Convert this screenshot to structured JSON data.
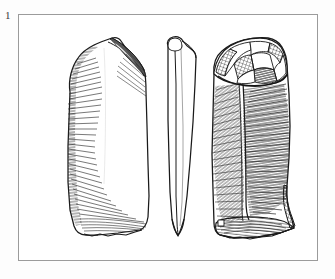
{
  "figure": {
    "label": "1",
    "kind": "archaeological-lithic-illustration",
    "frame": {
      "border_color": "#9b9b9b",
      "fill_color": "#ffffff",
      "x": 18,
      "y": 14,
      "width": 300,
      "height": 247
    },
    "background_color": "#fdfdfd",
    "ink_color": "#1a1a1a",
    "shading_color": "#2b2b2b"
  },
  "views": [
    {
      "id": "dorsal-view",
      "name": "Dorsal face",
      "position": "left",
      "shading": "fine parallel hatching along left margin and basal edge",
      "features": [
        "struck platform at top",
        "curved lateral edge",
        "truncated base"
      ]
    },
    {
      "id": "profile-view",
      "name": "Lateral profile",
      "position": "centre",
      "shading": "outline only",
      "features": [
        "thin elongated section",
        "bulb at proximal end",
        "tapering distal tip"
      ]
    },
    {
      "id": "ventral-view",
      "name": "Ventral face",
      "position": "right",
      "shading": "dense parallel hatching with crosshatched platform facets",
      "features": [
        "faceted striking platform",
        "longitudinal flake ridge",
        "flat truncated base"
      ]
    }
  ],
  "icons": {
    "plate_number": "1"
  }
}
